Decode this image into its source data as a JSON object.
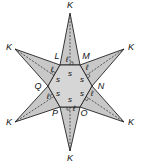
{
  "diagram": {
    "type": "geometric-figure",
    "colors": {
      "fill": "#c8c8c8",
      "stroke": "#222222",
      "background": "#ffffff"
    },
    "hexagon": {
      "vertices": [
        {
          "label": "L",
          "x": 60,
          "y": 65,
          "lx": 57,
          "ly": 59
        },
        {
          "label": "M",
          "x": 80,
          "y": 65,
          "lx": 86,
          "ly": 59
        },
        {
          "label": "N",
          "x": 92,
          "y": 86,
          "lx": 101,
          "ly": 89
        },
        {
          "label": "O",
          "x": 80,
          "y": 107,
          "lx": 84,
          "ly": 116
        },
        {
          "label": "P",
          "x": 60,
          "y": 107,
          "lx": 55,
          "ly": 116
        },
        {
          "label": "Q",
          "x": 48,
          "y": 86,
          "lx": 38,
          "ly": 89
        }
      ],
      "side_label": "s",
      "side_labels": [
        {
          "x": 70,
          "y": 76
        },
        {
          "x": 82,
          "y": 82
        },
        {
          "x": 82,
          "y": 96
        },
        {
          "x": 70,
          "y": 102
        },
        {
          "x": 58,
          "y": 96
        },
        {
          "x": 58,
          "y": 82
        }
      ]
    },
    "points": {
      "label": "K",
      "tips": [
        {
          "x": 70,
          "y": 13,
          "lx": 70,
          "ly": 8
        },
        {
          "x": 124,
          "y": 49,
          "lx": 131,
          "ly": 50
        },
        {
          "x": 124,
          "y": 122,
          "lx": 131,
          "ly": 125
        },
        {
          "x": 70,
          "y": 151,
          "lx": 70,
          "ly": 161
        },
        {
          "x": 15,
          "y": 122,
          "lx": 9,
          "ly": 125
        },
        {
          "x": 15,
          "y": 49,
          "lx": 9,
          "ly": 50
        }
      ]
    },
    "apothem_label": "ℓ",
    "apothem_labels": [
      {
        "x": 67,
        "y": 62
      },
      {
        "x": 87,
        "y": 70
      },
      {
        "x": 92,
        "y": 96
      },
      {
        "x": 74,
        "y": 111
      },
      {
        "x": 52,
        "y": 72
      },
      {
        "x": 48,
        "y": 99
      }
    ]
  }
}
